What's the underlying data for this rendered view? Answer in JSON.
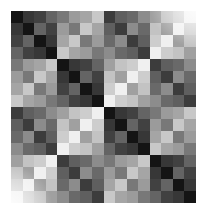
{
  "chart_data": {
    "type": "heatmap",
    "title": "",
    "xlabel": "",
    "ylabel": "",
    "rows": 16,
    "cols": 16,
    "colormap": "grayscale (low = black, high = white)",
    "value_range": [
      0,
      255
    ],
    "grid": false,
    "legend": "none",
    "x_tick_labels": [],
    "y_tick_labels": [],
    "matrix": [
      [
        20,
        55,
        65,
        100,
        120,
        155,
        165,
        200,
        60,
        95,
        105,
        140,
        160,
        195,
        205,
        240
      ],
      [
        55,
        20,
        100,
        65,
        155,
        120,
        200,
        165,
        95,
        60,
        140,
        105,
        195,
        160,
        240,
        205
      ],
      [
        65,
        100,
        20,
        55,
        165,
        200,
        120,
        155,
        105,
        140,
        60,
        95,
        205,
        240,
        160,
        195
      ],
      [
        100,
        65,
        55,
        20,
        200,
        165,
        155,
        120,
        140,
        105,
        95,
        60,
        240,
        205,
        195,
        160
      ],
      [
        120,
        155,
        165,
        200,
        20,
        55,
        65,
        100,
        160,
        195,
        205,
        240,
        60,
        95,
        105,
        140
      ],
      [
        155,
        120,
        200,
        165,
        55,
        20,
        100,
        65,
        195,
        160,
        240,
        205,
        95,
        60,
        140,
        105
      ],
      [
        165,
        200,
        120,
        155,
        65,
        100,
        20,
        55,
        205,
        240,
        160,
        195,
        105,
        140,
        60,
        95
      ],
      [
        200,
        165,
        155,
        120,
        100,
        65,
        55,
        20,
        240,
        205,
        195,
        160,
        140,
        105,
        95,
        60
      ],
      [
        60,
        95,
        105,
        140,
        160,
        195,
        205,
        240,
        20,
        55,
        65,
        100,
        120,
        155,
        165,
        200
      ],
      [
        95,
        60,
        140,
        105,
        195,
        160,
        240,
        205,
        55,
        20,
        100,
        65,
        155,
        120,
        200,
        165
      ],
      [
        105,
        140,
        60,
        95,
        205,
        240,
        160,
        195,
        65,
        100,
        20,
        55,
        165,
        200,
        120,
        155
      ],
      [
        140,
        105,
        95,
        60,
        240,
        205,
        195,
        160,
        100,
        65,
        55,
        20,
        200,
        165,
        155,
        120
      ],
      [
        160,
        195,
        205,
        240,
        60,
        95,
        105,
        140,
        120,
        155,
        165,
        200,
        20,
        55,
        65,
        100
      ],
      [
        195,
        160,
        240,
        205,
        95,
        60,
        140,
        105,
        155,
        120,
        200,
        165,
        55,
        20,
        100,
        65
      ],
      [
        205,
        240,
        160,
        195,
        105,
        140,
        60,
        95,
        165,
        200,
        120,
        155,
        65,
        100,
        20,
        55
      ],
      [
        240,
        205,
        195,
        160,
        140,
        105,
        95,
        60,
        200,
        165,
        155,
        120,
        100,
        65,
        55,
        20
      ]
    ]
  }
}
